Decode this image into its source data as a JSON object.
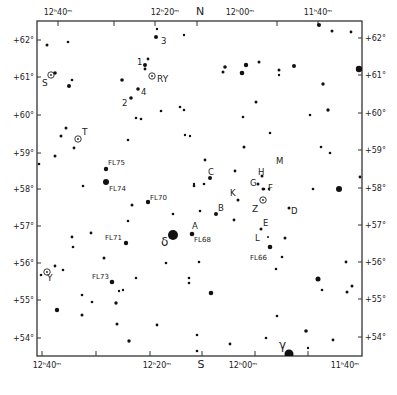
{
  "chart_data": {
    "type": "scatter",
    "title": "",
    "frame": {
      "left": 37,
      "right": 362,
      "top": 21,
      "bottom": 356
    },
    "top_labels": [
      {
        "text": "12ʰ40ᵐ",
        "x": 58
      },
      {
        "text": "12ʰ20ᵐ",
        "x": 165
      },
      {
        "text": "N",
        "x": 200
      },
      {
        "text": "12ʰ00ᵐ",
        "x": 240
      },
      {
        "text": "11ʰ40ᵐ",
        "x": 318
      }
    ],
    "bottom_labels": [
      {
        "text": "12ʰ40ᵐ",
        "x": 47
      },
      {
        "text": "12ʰ20ᵐ",
        "x": 157
      },
      {
        "text": "S",
        "x": 201
      },
      {
        "text": "12ʰ00ᵐ",
        "x": 243
      },
      {
        "text": "11ʰ40ᵐ",
        "x": 345
      }
    ],
    "top_ticks": [
      58,
      114,
      155,
      197,
      277,
      318
    ],
    "bottom_ticks": [
      42,
      96,
      150,
      202,
      255,
      308
    ],
    "left_labels": [
      {
        "text": "+62°",
        "y": 40
      },
      {
        "text": "+61°",
        "y": 77
      },
      {
        "text": "+60°",
        "y": 115
      },
      {
        "text": "+59°",
        "y": 153
      },
      {
        "text": "+58°",
        "y": 189
      },
      {
        "text": "+57°",
        "y": 226
      },
      {
        "text": "+56°",
        "y": 263
      },
      {
        "text": "+55°",
        "y": 300
      },
      {
        "text": "+54°",
        "y": 338
      }
    ],
    "right_labels": [
      {
        "text": "+62°",
        "y": 38
      },
      {
        "text": "+61°",
        "y": 75
      },
      {
        "text": "+60°",
        "y": 113
      },
      {
        "text": "+59°",
        "y": 150
      },
      {
        "text": "+58°",
        "y": 188
      },
      {
        "text": "+57°",
        "y": 225
      },
      {
        "text": "+56°",
        "y": 262
      },
      {
        "text": "+55°",
        "y": 299
      },
      {
        "text": "+54°",
        "y": 337
      }
    ],
    "stars": [
      {
        "x": 47,
        "y": 45,
        "r": 1.5
      },
      {
        "x": 68,
        "y": 42,
        "r": 1.3
      },
      {
        "x": 157,
        "y": 29,
        "r": 1.2
      },
      {
        "x": 156,
        "y": 37,
        "r": 2
      },
      {
        "x": 55,
        "y": 73,
        "r": 1.8
      },
      {
        "x": 69,
        "y": 86,
        "r": 2
      },
      {
        "x": 72,
        "y": 80,
        "r": 1.3
      },
      {
        "x": 122,
        "y": 80,
        "r": 1.8
      },
      {
        "x": 148,
        "y": 59,
        "r": 1.4
      },
      {
        "x": 145,
        "y": 65,
        "r": 2
      },
      {
        "x": 145,
        "y": 69,
        "r": 1.4
      },
      {
        "x": 138,
        "y": 89,
        "r": 1.8
      },
      {
        "x": 131,
        "y": 98,
        "r": 1.8
      },
      {
        "x": 161,
        "y": 111,
        "r": 1.3
      },
      {
        "x": 136,
        "y": 118,
        "r": 1.3
      },
      {
        "x": 141,
        "y": 119,
        "r": 1.3
      },
      {
        "x": 180,
        "y": 107,
        "r": 1.3
      },
      {
        "x": 184,
        "y": 110,
        "r": 1.3
      },
      {
        "x": 184,
        "y": 35,
        "r": 1.2
      },
      {
        "x": 225,
        "y": 67,
        "r": 1.8
      },
      {
        "x": 246,
        "y": 65,
        "r": 2.2
      },
      {
        "x": 242,
        "y": 73,
        "r": 2.3
      },
      {
        "x": 259,
        "y": 62,
        "r": 1.5
      },
      {
        "x": 223,
        "y": 72,
        "r": 1.5
      },
      {
        "x": 279,
        "y": 70,
        "r": 1.5
      },
      {
        "x": 279,
        "y": 75,
        "r": 1.2
      },
      {
        "x": 294,
        "y": 66,
        "r": 2
      },
      {
        "x": 319,
        "y": 25,
        "r": 2
      },
      {
        "x": 332,
        "y": 31,
        "r": 1.5
      },
      {
        "x": 351,
        "y": 32,
        "r": 1.4
      },
      {
        "x": 359,
        "y": 69,
        "r": 3.2
      },
      {
        "x": 323,
        "y": 84,
        "r": 1.7
      },
      {
        "x": 256,
        "y": 102,
        "r": 1.5
      },
      {
        "x": 243,
        "y": 117,
        "r": 1.3
      },
      {
        "x": 310,
        "y": 115,
        "r": 1.3
      },
      {
        "x": 328,
        "y": 110,
        "r": 1.7
      },
      {
        "x": 66,
        "y": 128,
        "r": 1.5
      },
      {
        "x": 61,
        "y": 136,
        "r": 1.5
      },
      {
        "x": 74,
        "y": 148,
        "r": 1.4
      },
      {
        "x": 55,
        "y": 156,
        "r": 1.5
      },
      {
        "x": 39,
        "y": 164,
        "r": 1.3
      },
      {
        "x": 128,
        "y": 140,
        "r": 1.3
      },
      {
        "x": 185,
        "y": 135,
        "r": 1.2
      },
      {
        "x": 190,
        "y": 136,
        "r": 1.2
      },
      {
        "x": 83,
        "y": 186,
        "r": 1.3
      },
      {
        "x": 106,
        "y": 169,
        "r": 2.2
      },
      {
        "x": 106,
        "y": 182,
        "r": 3
      },
      {
        "x": 194,
        "y": 184,
        "r": 1.2
      },
      {
        "x": 270,
        "y": 133,
        "r": 1.3
      },
      {
        "x": 205,
        "y": 160,
        "r": 1.4
      },
      {
        "x": 204,
        "y": 184,
        "r": 1.3
      },
      {
        "x": 194,
        "y": 186,
        "r": 1.3
      },
      {
        "x": 244,
        "y": 147,
        "r": 1.5
      },
      {
        "x": 321,
        "y": 147,
        "r": 1.3
      },
      {
        "x": 330,
        "y": 153,
        "r": 1.3
      },
      {
        "x": 360,
        "y": 177,
        "r": 1.4
      },
      {
        "x": 339,
        "y": 189,
        "r": 3
      },
      {
        "x": 313,
        "y": 189,
        "r": 1.3
      },
      {
        "x": 210,
        "y": 178,
        "r": 2
      },
      {
        "x": 235,
        "y": 171,
        "r": 1.4
      },
      {
        "x": 132,
        "y": 205,
        "r": 1.5
      },
      {
        "x": 148,
        "y": 202,
        "r": 2.2
      },
      {
        "x": 173,
        "y": 214,
        "r": 1.3
      },
      {
        "x": 128,
        "y": 221,
        "r": 1.3
      },
      {
        "x": 200,
        "y": 211,
        "r": 1.3
      },
      {
        "x": 216,
        "y": 214,
        "r": 2
      },
      {
        "x": 238,
        "y": 200,
        "r": 1.5
      },
      {
        "x": 258,
        "y": 184,
        "r": 1.5
      },
      {
        "x": 263,
        "y": 189,
        "r": 1.5
      },
      {
        "x": 264,
        "y": 189,
        "r": 1.3
      },
      {
        "x": 262,
        "y": 176,
        "r": 1.5
      },
      {
        "x": 269,
        "y": 189,
        "r": 1.3
      },
      {
        "x": 289,
        "y": 208,
        "r": 1.5
      },
      {
        "x": 234,
        "y": 220,
        "r": 1.4
      },
      {
        "x": 261,
        "y": 229,
        "r": 1.5
      },
      {
        "x": 268,
        "y": 237,
        "r": 1
      },
      {
        "x": 285,
        "y": 238,
        "r": 1.5
      },
      {
        "x": 270,
        "y": 247,
        "r": 2.3
      },
      {
        "x": 173,
        "y": 235,
        "r": 5
      },
      {
        "x": 192,
        "y": 234,
        "r": 2.3
      },
      {
        "x": 72,
        "y": 237,
        "r": 1.4
      },
      {
        "x": 73,
        "y": 247,
        "r": 1.3
      },
      {
        "x": 91,
        "y": 233,
        "r": 1.4
      },
      {
        "x": 126,
        "y": 243,
        "r": 2.2
      },
      {
        "x": 104,
        "y": 258,
        "r": 1.5
      },
      {
        "x": 166,
        "y": 263,
        "r": 1.3
      },
      {
        "x": 199,
        "y": 262,
        "r": 1.3
      },
      {
        "x": 282,
        "y": 257,
        "r": 1.3
      },
      {
        "x": 276,
        "y": 269,
        "r": 1.3
      },
      {
        "x": 318,
        "y": 279,
        "r": 2.5
      },
      {
        "x": 322,
        "y": 290,
        "r": 1.3
      },
      {
        "x": 346,
        "y": 262,
        "r": 1.4
      },
      {
        "x": 352,
        "y": 286,
        "r": 1.5
      },
      {
        "x": 347,
        "y": 292,
        "r": 1.5
      },
      {
        "x": 41,
        "y": 275,
        "r": 1.3
      },
      {
        "x": 55,
        "y": 266,
        "r": 1.4
      },
      {
        "x": 63,
        "y": 270,
        "r": 1.3
      },
      {
        "x": 112,
        "y": 282,
        "r": 2.3
      },
      {
        "x": 119,
        "y": 291,
        "r": 1.2
      },
      {
        "x": 123,
        "y": 290,
        "r": 1.2
      },
      {
        "x": 136,
        "y": 278,
        "r": 1.3
      },
      {
        "x": 82,
        "y": 295,
        "r": 1.3
      },
      {
        "x": 92,
        "y": 302,
        "r": 1.3
      },
      {
        "x": 116,
        "y": 303,
        "r": 1.7
      },
      {
        "x": 57,
        "y": 310,
        "r": 2.2
      },
      {
        "x": 82,
        "y": 315,
        "r": 1.5
      },
      {
        "x": 117,
        "y": 324,
        "r": 1.5
      },
      {
        "x": 129,
        "y": 341,
        "r": 1.7
      },
      {
        "x": 157,
        "y": 325,
        "r": 1.4
      },
      {
        "x": 189,
        "y": 278,
        "r": 1.3
      },
      {
        "x": 189,
        "y": 283,
        "r": 1.3
      },
      {
        "x": 211,
        "y": 293,
        "r": 2.3
      },
      {
        "x": 197,
        "y": 335,
        "r": 1.3
      },
      {
        "x": 197,
        "y": 351,
        "r": 1.3
      },
      {
        "x": 230,
        "y": 344,
        "r": 1.4
      },
      {
        "x": 266,
        "y": 338,
        "r": 1.3
      },
      {
        "x": 277,
        "y": 316,
        "r": 1.3
      },
      {
        "x": 306,
        "y": 331,
        "r": 1.8
      },
      {
        "x": 308,
        "y": 348,
        "r": 1.2
      },
      {
        "x": 333,
        "y": 340,
        "r": 1.4
      },
      {
        "x": 289,
        "y": 354,
        "r": 4.5
      }
    ],
    "variables": [
      {
        "label": "S",
        "x": 51,
        "y": 75,
        "lx": 42,
        "ly": 86
      },
      {
        "label": "RY",
        "x": 152,
        "y": 76,
        "lx": 157,
        "ly": 82
      },
      {
        "label": "T",
        "x": 78,
        "y": 139,
        "lx": 82,
        "ly": 135
      },
      {
        "label": "Z",
        "x": 263,
        "y": 200,
        "lx": 252,
        "ly": 212
      },
      {
        "label": "Y",
        "x": 47,
        "y": 272,
        "lx": 47,
        "ly": 281
      }
    ],
    "star_labels": [
      {
        "text": "3",
        "x": 161,
        "y": 44
      },
      {
        "text": "1",
        "x": 137,
        "y": 65
      },
      {
        "text": "4",
        "x": 141,
        "y": 95
      },
      {
        "text": "2",
        "x": 122,
        "y": 106
      },
      {
        "text": "FL75",
        "x": 108,
        "y": 165
      },
      {
        "text": "FL74",
        "x": 109,
        "y": 191
      },
      {
        "text": "FL70",
        "x": 150,
        "y": 200
      },
      {
        "text": "FL71",
        "x": 105,
        "y": 240
      },
      {
        "text": "δ",
        "x": 161,
        "y": 246
      },
      {
        "text": "A",
        "x": 192,
        "y": 229
      },
      {
        "text": "FL68",
        "x": 194,
        "y": 242
      },
      {
        "text": "FL73",
        "x": 92,
        "y": 279
      },
      {
        "text": "C",
        "x": 208,
        "y": 175
      },
      {
        "text": "B",
        "x": 218,
        "y": 211
      },
      {
        "text": "K",
        "x": 230,
        "y": 196
      },
      {
        "text": "H",
        "x": 258,
        "y": 175
      },
      {
        "text": "M",
        "x": 276,
        "y": 164
      },
      {
        "text": "G",
        "x": 250,
        "y": 186
      },
      {
        "text": "F",
        "x": 268,
        "y": 191
      },
      {
        "text": "D",
        "x": 291,
        "y": 214
      },
      {
        "text": "E",
        "x": 263,
        "y": 226
      },
      {
        "text": "L",
        "x": 255,
        "y": 241
      },
      {
        "text": "FL66",
        "x": 250,
        "y": 260
      },
      {
        "text": "γ",
        "x": 279,
        "y": 349
      }
    ]
  }
}
